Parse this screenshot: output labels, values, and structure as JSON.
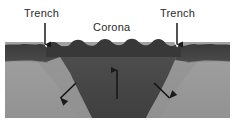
{
  "figure": {
    "width": 235,
    "height": 124,
    "background_color": "#ffffff"
  },
  "labels": {
    "trench_left": "Trench",
    "trench_right": "Trench",
    "corona": "Corona"
  },
  "annotations": {
    "pointer_left": {
      "name": "trench-left-pointer-arrow",
      "direction": "down",
      "x": 45,
      "y_start": 23,
      "y_end": 45
    },
    "pointer_right": {
      "name": "trench-right-pointer-arrow",
      "direction": "down",
      "x": 177,
      "y_start": 23,
      "y_end": 45
    },
    "upwelling": {
      "name": "central-upwelling-arrow",
      "direction": "up",
      "x": 117,
      "y_start": 98,
      "y_end": 70
    },
    "subduction_left": {
      "name": "left-subduction-arrow",
      "direction": "down-left",
      "x_start": 76,
      "y_start": 84,
      "x_end": 60,
      "y_end": 99
    },
    "subduction_right": {
      "name": "right-subduction-arrow",
      "direction": "down-right",
      "x_start": 154,
      "y_start": 84,
      "x_end": 170,
      "y_end": 99
    }
  },
  "colors": {
    "crust_dark": "#3a3a3a",
    "corona_body": "#4a4a4a",
    "corona_body_deep": "#434343",
    "mantle_light": "#9a9a9a",
    "mantle_light_shade": "#8e8e8e",
    "crust_band_edge": "#555555",
    "outline": "#2b2b2b",
    "arrow": "#1a1a1a",
    "text": "#2b2b2b",
    "background": "#ffffff"
  },
  "geology": {
    "layers": [
      {
        "name": "surface-crust",
        "label": "dark upper crust band",
        "color": "#3a3a3a"
      },
      {
        "name": "corona-plume",
        "label": "dark corona / rising plume",
        "color": "#4a4a4a"
      },
      {
        "name": "mantle",
        "label": "light grey mantle",
        "color": "#9a9a9a"
      }
    ],
    "features": [
      {
        "name": "corona-crest",
        "label": "wavy corona crest ridges",
        "count": 8
      },
      {
        "name": "trench-left",
        "label": "left trench depression"
      },
      {
        "name": "trench-right",
        "label": "right trench depression"
      }
    ]
  }
}
